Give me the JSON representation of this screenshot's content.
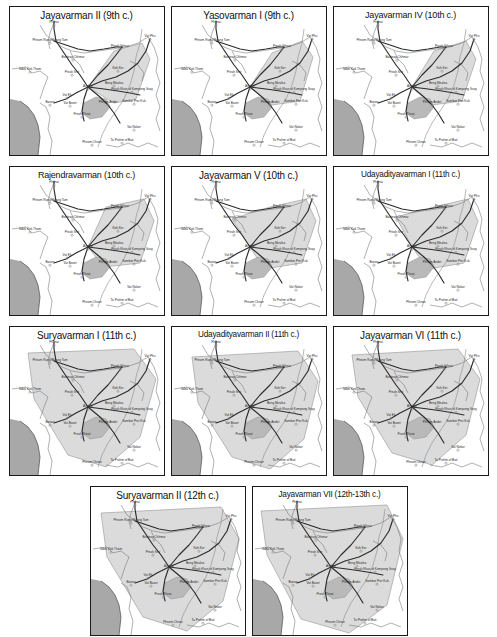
{
  "figure": {
    "kind": "multi-panel-map-series",
    "panel_count": 11,
    "rows": [
      3,
      3,
      3,
      2
    ]
  },
  "colors": {
    "territory_fill": "#d9d9d9",
    "territory_stroke": "#9a9a9a",
    "sea_fill": "#a8a8a8",
    "land_fill": "#ffffff",
    "coast_stroke": "#5a5a5a",
    "border_stroke": "#707070",
    "road_stroke": "#2b2b2b",
    "panel_border": "#1a1a1a",
    "label_text": "#2a2a2a",
    "title_text": "#111111",
    "site_marker": "#8c8c8c"
  },
  "places": [
    {
      "id": "phimai",
      "name": "Phimai",
      "x": 44,
      "y": 16,
      "marker": true,
      "anchor": "middle"
    },
    {
      "id": "phnom-rung",
      "name": "Phnom Rung/Muang Tam",
      "x": 40,
      "y": 34,
      "marker": true,
      "anchor": "middle"
    },
    {
      "id": "banteay-chhmar",
      "name": "Banteay Chhmar",
      "x": 63,
      "y": 51,
      "marker": true,
      "anchor": "middle"
    },
    {
      "id": "sdok-kok-thom",
      "name": "Sdok Kok Thom",
      "x": 20,
      "y": 63,
      "marker": true,
      "anchor": "middle"
    },
    {
      "id": "preah-sralao",
      "name": "Preah Srei",
      "x": 62,
      "y": 66,
      "marker": true,
      "anchor": "middle"
    },
    {
      "id": "preah-vihear",
      "name": "Preah Vihear",
      "x": 110,
      "y": 40,
      "marker": true,
      "anchor": "middle"
    },
    {
      "id": "wat-phu",
      "name": "Vat Phu",
      "x": 140,
      "y": 30,
      "marker": true,
      "anchor": "middle"
    },
    {
      "id": "koh-ker",
      "name": "Koh Ker",
      "x": 108,
      "y": 62,
      "marker": true,
      "anchor": "middle"
    },
    {
      "id": "angkor",
      "name": "Angkor",
      "x": 78,
      "y": 80,
      "marker": true,
      "anchor": "middle"
    },
    {
      "id": "beng-mealea",
      "name": "Beng Mealea",
      "x": 104,
      "y": 77,
      "marker": true,
      "anchor": "middle"
    },
    {
      "id": "preah-khan-kompong",
      "name": "Preah Khan of Kompong Svay",
      "x": 122,
      "y": 83,
      "marker": true,
      "anchor": "middle"
    },
    {
      "id": "vat-ek",
      "name": "Vat Ek",
      "x": 57,
      "y": 89,
      "marker": true,
      "anchor": "middle"
    },
    {
      "id": "vat-baset",
      "name": "Vat Baset",
      "x": 60,
      "y": 97,
      "marker": true,
      "anchor": "middle"
    },
    {
      "id": "banon",
      "name": "Banon",
      "x": 40,
      "y": 96,
      "marker": true,
      "anchor": "middle"
    },
    {
      "id": "phnom-andet",
      "name": "Phnom Andet",
      "x": 98,
      "y": 96,
      "marker": true,
      "anchor": "middle"
    },
    {
      "id": "sambor-prei-kuk",
      "name": "Sambor Prei Kuk",
      "x": 124,
      "y": 95,
      "marker": true,
      "anchor": "middle"
    },
    {
      "id": "preah-theat",
      "name": "Preah Theat",
      "x": 72,
      "y": 108,
      "marker": true,
      "anchor": "middle"
    },
    {
      "id": "vat-nokor",
      "name": "Vat Nokor",
      "x": 124,
      "y": 121,
      "marker": true,
      "anchor": "middle"
    },
    {
      "id": "phnom-chisor",
      "name": "Phnom Chisor",
      "x": 82,
      "y": 136,
      "marker": true,
      "anchor": "middle"
    },
    {
      "id": "ta-prohm-bati",
      "name": "Ta Prohm of Bati",
      "x": 112,
      "y": 134,
      "marker": true,
      "anchor": "middle"
    }
  ],
  "panels": [
    {
      "id": "jayavarman-ii",
      "title": "Jayavarman II (9th c.)",
      "ruler": "Jayavarman II",
      "century": "9th c.",
      "title_size": "normal",
      "territory": "M 78,80 L 104,44 L 132,36 L 140,52 L 126,92 L 104,96 Z"
    },
    {
      "id": "yasovarman-i",
      "title": "Yasovarman I (9th c.)",
      "ruler": "Yasovarman I",
      "century": "9th c.",
      "title_size": "normal",
      "territory": "M 78,80 L 100,46 L 130,34 L 141,50 L 128,94 L 100,98 Z"
    },
    {
      "id": "jayavarman-iv",
      "title": "Jayavarman IV (10th c.)",
      "ruler": "Jayavarman IV",
      "century": "10th c.",
      "title_size": "wide",
      "territory": "M 78,80 L 100,44 L 132,34 L 142,52 L 128,94 L 98,98 Z"
    },
    {
      "id": "rajendravarman",
      "title": "Rajendravarman (10th c.)",
      "ruler": "Rajendravarman",
      "century": "10th c.",
      "title_size": "wide",
      "territory": "M 78,80 L 96,40 L 134,32 L 144,54 L 130,96 L 94,100 Z"
    },
    {
      "id": "jayavarman-v",
      "title": "Jayavarman V (10th c.)",
      "ruler": "Jayavarman V",
      "century": "10th c.",
      "title_size": "normal",
      "territory": "M 78,80 L 60,52 L 98,40 L 134,32 L 144,54 L 130,96 L 92,102 Z"
    },
    {
      "id": "udayadityavarman-i",
      "title": "Udayadityavarman I (11th c.)",
      "ruler": "Udayadityavarman I",
      "century": "11th c.",
      "title_size": "xwide",
      "territory": "M 78,80 L 62,50 L 100,40 L 134,32 L 144,54 L 130,96 L 94,102 Z"
    },
    {
      "id": "suryavarman-i",
      "title": "Suryavarman I (11th c.)",
      "ruler": "Suryavarman I",
      "century": "11th c.",
      "title_size": "normal",
      "territory": "M 18,26 L 124,22 L 146,52 L 130,110 L 96,140 L 58,128 L 24,72 Z"
    },
    {
      "id": "udayadityavarman-ii",
      "title": "Udayadityavarman II (11th c.)",
      "ruler": "Udayadityavarman II",
      "century": "11th c.",
      "title_size": "xwide",
      "territory": "M 20,30 L 126,24 L 146,54 L 132,112 L 98,142 L 60,130 L 26,76 Z"
    },
    {
      "id": "jayavarman-vi",
      "title": "Jayavarman VI (11th c.)",
      "ruler": "Jayavarman VI",
      "century": "11th c.",
      "title_size": "normal",
      "territory": "M 18,28 L 124,22 L 146,52 L 132,108 L 98,138 L 58,126 L 24,70 Z"
    },
    {
      "id": "suryavarman-ii",
      "title": "Suryavarman II (12th c.)",
      "ruler": "Suryavarman II",
      "century": "12th c.",
      "title_size": "normal",
      "territory": "M 10,26 L 130,20 L 148,52 L 132,114 L 96,144 L 52,130 L 16,70 Z"
    },
    {
      "id": "jayavarman-vii",
      "title": "Jayavarman VII (12th-13th c.)",
      "ruler": "Jayavarman VII",
      "century": "12th-13th c.",
      "title_size": "xwide",
      "territory": "M 8,24 L 134,18 L 150,52 L 134,118 L 96,146 L 48,132 L 14,68 Z"
    }
  ]
}
